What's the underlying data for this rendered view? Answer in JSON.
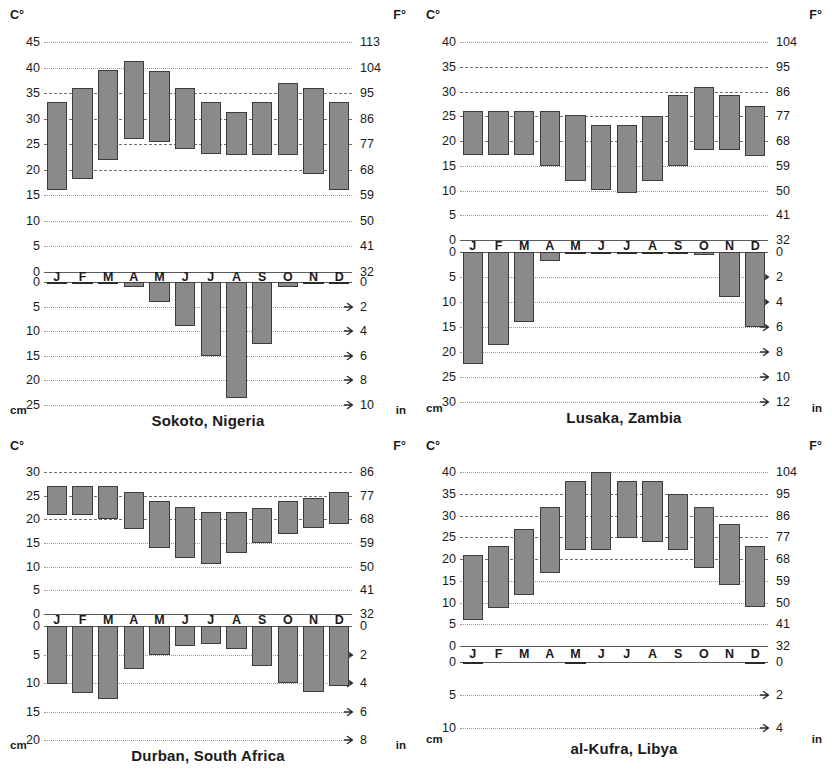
{
  "figure": {
    "type": "climograph-grid",
    "rows": 2,
    "cols": 2,
    "axis_labels": {
      "temp_left": "C°",
      "temp_right": "F°",
      "precip_left": "cm",
      "precip_right": "in"
    },
    "months": [
      "J",
      "F",
      "M",
      "A",
      "M",
      "J",
      "J",
      "A",
      "S",
      "O",
      "N",
      "D"
    ],
    "colors": {
      "bar_fill": "#8a8a8a",
      "bar_stroke": "#3c3c3c",
      "gridline": "#9a9a9a",
      "axis": "#5a5a5a",
      "text": "#1a1a1a"
    }
  },
  "charts": [
    {
      "id": "sokoto",
      "title": "Sokoto, Nigeria",
      "temp": {
        "c_ticks": [
          45,
          40,
          35,
          30,
          25,
          20,
          15,
          10,
          5,
          0
        ],
        "f_ticks": [
          113,
          104,
          95,
          86,
          77,
          68,
          59,
          50,
          41,
          32
        ],
        "c_min": 0,
        "c_max": 45,
        "lows": [
          16.0,
          18.2,
          22.0,
          26.0,
          25.5,
          24.0,
          23.0,
          22.8,
          22.8,
          22.8,
          19.2,
          16.0
        ],
        "highs": [
          33.3,
          36.0,
          39.5,
          41.2,
          39.3,
          36.0,
          33.3,
          31.3,
          33.3,
          37.0,
          36.0,
          33.3
        ]
      },
      "precip": {
        "cm_ticks": [
          0,
          5,
          10,
          15,
          20,
          25
        ],
        "in_ticks": [
          0,
          2,
          4,
          6,
          8,
          10
        ],
        "cm_max": 25,
        "values": [
          0.2,
          0.2,
          0.3,
          1.0,
          4.0,
          9.0,
          15.0,
          23.5,
          12.7,
          1.0,
          0.2,
          0.1
        ]
      }
    },
    {
      "id": "lusaka",
      "title": "Lusaka, Zambia",
      "temp": {
        "c_ticks": [
          40,
          35,
          30,
          25,
          20,
          15,
          10,
          5,
          0
        ],
        "f_ticks": [
          104,
          95,
          86,
          77,
          68,
          59,
          50,
          41,
          32
        ],
        "c_min": 0,
        "c_max": 40,
        "lows": [
          17.2,
          17.2,
          17.2,
          15.0,
          12.0,
          10.2,
          9.5,
          12.0,
          15.0,
          18.2,
          18.2,
          17.0
        ],
        "highs": [
          26.0,
          26.0,
          26.0,
          26.0,
          25.2,
          23.2,
          23.2,
          25.0,
          29.2,
          31.0,
          29.2,
          27.0
        ]
      },
      "precip": {
        "cm_ticks": [
          0,
          5,
          10,
          15,
          20,
          25,
          30
        ],
        "in_ticks": [
          0,
          2,
          4,
          6,
          8,
          10,
          12
        ],
        "cm_max": 30,
        "values": [
          22.3,
          18.6,
          14.0,
          1.8,
          0.3,
          0.1,
          0.1,
          0.1,
          0.2,
          0.6,
          8.9,
          15.0
        ]
      }
    },
    {
      "id": "durban",
      "title": "Durban, South Africa",
      "temp": {
        "c_ticks": [
          30,
          25,
          20,
          15,
          10,
          5,
          0
        ],
        "f_ticks": [
          86,
          77,
          68,
          59,
          50,
          41,
          32
        ],
        "c_min": 0,
        "c_max": 30,
        "lows": [
          21.0,
          21.0,
          20.0,
          18.0,
          14.0,
          11.8,
          10.5,
          12.8,
          15.0,
          16.8,
          18.2,
          19.0
        ],
        "highs": [
          27.0,
          27.0,
          27.0,
          25.8,
          23.8,
          22.6,
          21.5,
          21.5,
          22.5,
          23.8,
          24.6,
          25.8
        ]
      },
      "precip": {
        "cm_ticks": [
          0,
          5,
          10,
          15,
          20
        ],
        "in_ticks": [
          0,
          2,
          4,
          6,
          8
        ],
        "cm_max": 20,
        "values": [
          10.2,
          11.8,
          12.8,
          7.5,
          5.0,
          3.5,
          3.2,
          4.0,
          7.0,
          10.0,
          11.5,
          10.5
        ]
      }
    },
    {
      "id": "al-kufra",
      "title": "al-Kufra, Libya",
      "temp": {
        "c_ticks": [
          40,
          35,
          30,
          25,
          20,
          15,
          10,
          5,
          0
        ],
        "f_ticks": [
          104,
          95,
          86,
          77,
          68,
          59,
          50,
          41,
          32
        ],
        "c_min": 0,
        "c_max": 40,
        "lows": [
          6.0,
          8.8,
          11.8,
          16.8,
          22.0,
          22.0,
          24.8,
          24.0,
          22.0,
          18.0,
          14.0,
          9.0
        ],
        "highs": [
          21.0,
          23.0,
          27.0,
          32.0,
          38.0,
          40.0,
          38.0,
          38.0,
          35.0,
          32.0,
          28.0,
          23.0
        ]
      },
      "precip": {
        "cm_ticks": [
          0,
          5,
          10
        ],
        "in_ticks": [
          0,
          2,
          4
        ],
        "cm_max": 10,
        "values": [
          0.12,
          0.0,
          0.0,
          0.0,
          0.12,
          0.0,
          0.0,
          0.0,
          0.0,
          0.0,
          0.0,
          0.15
        ]
      }
    }
  ]
}
